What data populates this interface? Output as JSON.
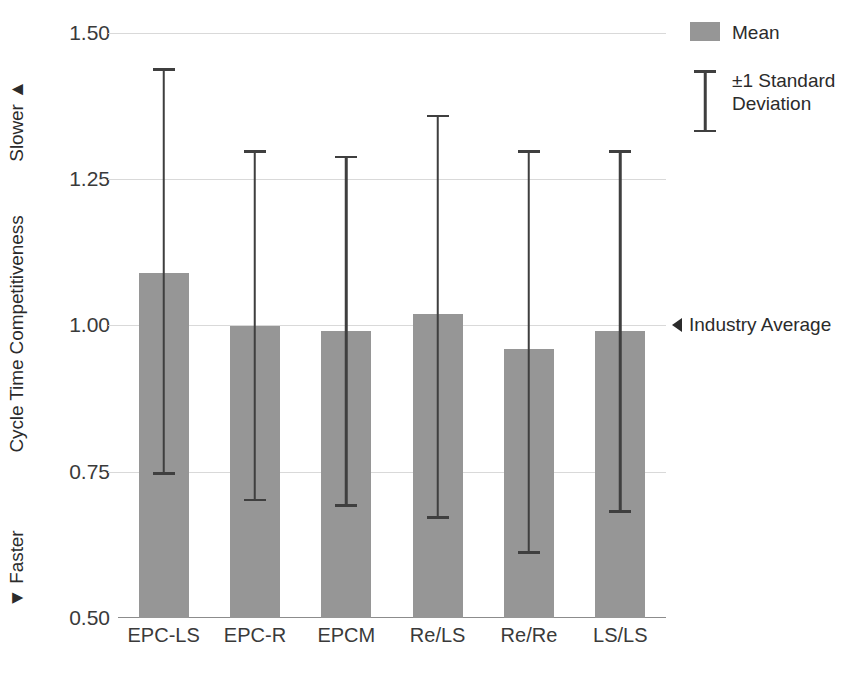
{
  "chart_data": {
    "type": "bar",
    "title": "",
    "xlabel": "",
    "ylabel": "Cycle Time Competitiveness",
    "ylim": [
      0.5,
      1.5
    ],
    "yticks": [
      "0.50",
      "0.75",
      "1.00",
      "1.25",
      "1.50"
    ],
    "grid": true,
    "categories": [
      "EPC-LS",
      "EPC-R",
      "EPCM",
      "Re/LS",
      "Re/Re",
      "LS/LS"
    ],
    "series": [
      {
        "name": "Mean",
        "values": [
          1.09,
          1.0,
          0.99,
          1.02,
          0.96,
          0.99
        ]
      }
    ],
    "error_bars": {
      "name": "±1 Standard Deviation",
      "upper": [
        1.44,
        1.3,
        1.29,
        1.36,
        1.3,
        1.3
      ],
      "lower": [
        0.745,
        0.7,
        0.69,
        0.67,
        0.61,
        0.68
      ]
    },
    "annotations": [
      {
        "label": "Industry Average",
        "value": 1.0,
        "marker": "◄"
      },
      {
        "label": "Slower ▲",
        "position": "y-axis-top"
      },
      {
        "label": "▼ Faster",
        "position": "y-axis-bottom"
      }
    ],
    "legend": {
      "position": "right-top",
      "entries": [
        {
          "label": "Mean",
          "marker": "filled-square",
          "color": "#969696"
        },
        {
          "label": "±1 Standard\nDeviation",
          "marker": "i-beam",
          "color": "#3f3f3f"
        }
      ]
    },
    "colors": {
      "bar": "#969696",
      "error": "#3f3f3f",
      "grid": "#d9d9d9",
      "axis": "#8c8c8c",
      "text": "#2b2b2b"
    }
  },
  "axis": {
    "slower_label": "Slower ▲",
    "title_label": "Cycle Time Competitiveness",
    "faster_label": "▼ Faster",
    "ytick_0": "1.50",
    "ytick_1": "1.25",
    "ytick_2": "1.00",
    "ytick_3": "0.75",
    "ytick_4": "0.50"
  },
  "xlabels": {
    "c0": "EPC-LS",
    "c1": "EPC-R",
    "c2": "EPCM",
    "c3": "Re/LS",
    "c4": "Re/Re",
    "c5": "LS/LS"
  },
  "legend": {
    "mean_label": "Mean",
    "sd_label_line1": "±1 Standard",
    "sd_label_line2": "Deviation"
  },
  "industry_average": {
    "label": "Industry Average"
  }
}
